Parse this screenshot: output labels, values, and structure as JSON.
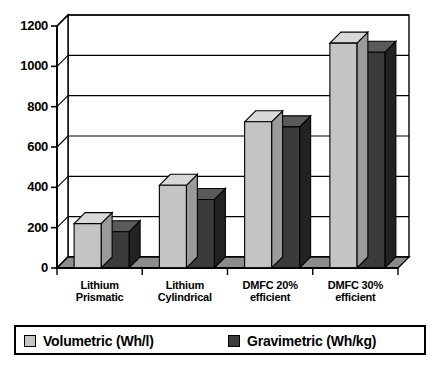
{
  "chart_data": {
    "type": "bar",
    "title": "",
    "subtitle": "",
    "xlabel": "",
    "ylabel": "",
    "ylim": [
      0,
      1200
    ],
    "ytick_values": [
      0,
      200,
      400,
      600,
      800,
      1000,
      1200
    ],
    "ytick_labels": [
      "0",
      "200",
      "400",
      "600",
      "800",
      "1000",
      "1200"
    ],
    "grid": true,
    "grid_axis": "y",
    "style": "3d-bar",
    "legend_position": "bottom",
    "categories": [
      "Lithium Prismatic",
      "Lithium Cylindrical",
      "DMFC 20% efficient",
      "DMFC 30% efficient"
    ],
    "category_lines": [
      [
        "Lithium",
        "Prismatic"
      ],
      [
        "Lithium",
        "Cylindrical"
      ],
      [
        "DMFC 20%",
        "efficient"
      ],
      [
        "DMFC 30%",
        "efficient"
      ]
    ],
    "series": [
      {
        "name": "Volumetric (Wh/l)",
        "color": "#c4c4c4",
        "values": [
          220,
          410,
          725,
          1115
        ]
      },
      {
        "name": "Gravimetric (Wh/kg)",
        "color": "#3b3b3b",
        "values": [
          180,
          340,
          700,
          1070
        ]
      }
    ]
  },
  "legend": {
    "entries": [
      {
        "label": "Volumetric (Wh/l)",
        "color": "#c4c4c4"
      },
      {
        "label": "Gravimetric (Wh/kg)",
        "color": "#3b3b3b"
      }
    ]
  },
  "colors": {
    "bar_light_front": "#c4c4c4",
    "bar_light_top": "#d8d8d8",
    "bar_light_side": "#9a9a9a",
    "bar_dark_front": "#3b3b3b",
    "bar_dark_top": "#5a5a5a",
    "bar_dark_side": "#222222",
    "axis": "#000000",
    "grid": "#555555",
    "floor": "#8c8c8c",
    "background": "#ffffff"
  }
}
